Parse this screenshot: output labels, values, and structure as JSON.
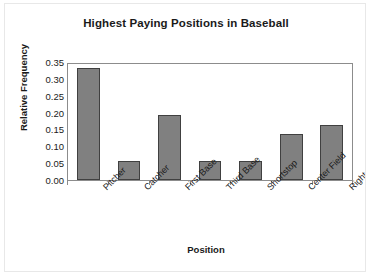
{
  "chart_data": {
    "type": "bar",
    "title": "Highest Paying Positions in Baseball",
    "xlabel": "Position",
    "ylabel": "Relative Frequency",
    "categories": [
      "Pitcher",
      "Catcher",
      "First Base",
      "Third Base",
      "Shortstop",
      "Center Field",
      "Right Field"
    ],
    "values": [
      0.333,
      0.055,
      0.194,
      0.055,
      0.055,
      0.137,
      0.164
    ],
    "ylim": [
      0.0,
      0.35
    ],
    "ytick_labels": [
      "0.35",
      "0.30",
      "0.25",
      "0.20",
      "0.15",
      "0.10",
      "0.05",
      "0.00"
    ],
    "ytick_values": [
      0.35,
      0.3,
      0.25,
      0.2,
      0.15,
      0.1,
      0.05,
      0.0
    ],
    "grid": false,
    "legend": "none",
    "bar_color": "#808080",
    "bar_border_color": "#404040",
    "axis_color": "#8c8c8c",
    "text_color": "#1a1a1a",
    "background": "#ffffff"
  }
}
